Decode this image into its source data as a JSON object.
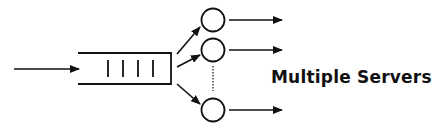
{
  "diagram": {
    "type": "multi-server-queue",
    "label": "Multiple Servers",
    "stroke_color": "#111111",
    "background": "#ffffff",
    "input_arrow": {
      "x1": 14,
      "y1": 69,
      "x2": 79,
      "y2": 69
    },
    "queue": {
      "x_left": 78,
      "x_right": 171,
      "y_top": 53,
      "y_bottom": 84,
      "slots": 4
    },
    "queue_slots": [
      {
        "x": 108,
        "y1": 60,
        "y2": 77
      },
      {
        "x": 123,
        "y1": 60,
        "y2": 77
      },
      {
        "x": 138,
        "y1": 60,
        "y2": 77
      },
      {
        "x": 153,
        "y1": 60,
        "y2": 77
      }
    ],
    "dispatch_arrows": [
      {
        "x1": 177,
        "y1": 54,
        "x2": 200,
        "y2": 27
      },
      {
        "x1": 177,
        "y1": 67,
        "x2": 200,
        "y2": 55
      },
      {
        "x1": 177,
        "y1": 84,
        "x2": 200,
        "y2": 104
      }
    ],
    "servers": [
      {
        "name": "server-1",
        "cx": 213,
        "cy": 20,
        "r": 11.5
      },
      {
        "name": "server-2",
        "cx": 213,
        "cy": 50,
        "r": 11.5
      },
      {
        "name": "server-n",
        "cx": 213,
        "cy": 110,
        "r": 11.5
      }
    ],
    "ellipsis_line": {
      "x": 213,
      "y1": 66,
      "y2": 91
    },
    "output_arrows": [
      {
        "x1": 229,
        "y1": 20,
        "x2": 282,
        "y2": 20
      },
      {
        "x1": 229,
        "y1": 50,
        "x2": 282,
        "y2": 50
      },
      {
        "x1": 229,
        "y1": 110,
        "x2": 282,
        "y2": 110
      }
    ]
  }
}
